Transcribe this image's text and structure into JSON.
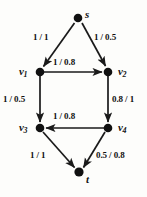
{
  "diagram": {
    "type": "directed-flow-network",
    "colors": {
      "node": "#111111",
      "edge": "#1a1a1a",
      "text": "#101010",
      "background": "#fdfdfb"
    },
    "nodes": [
      {
        "id": "s",
        "label": "s",
        "sub": "",
        "x": 78,
        "y": 18,
        "label_x": 85,
        "label_y": 9
      },
      {
        "id": "v1",
        "label": "v",
        "sub": "1",
        "x": 40,
        "y": 72,
        "label_x": 19,
        "label_y": 66
      },
      {
        "id": "v2",
        "label": "v",
        "sub": "2",
        "x": 108,
        "y": 72,
        "label_x": 118,
        "label_y": 66
      },
      {
        "id": "v3",
        "label": "v",
        "sub": "3",
        "x": 40,
        "y": 128,
        "label_x": 19,
        "label_y": 122
      },
      {
        "id": "v4",
        "label": "v",
        "sub": "4",
        "x": 108,
        "y": 128,
        "label_x": 118,
        "label_y": 122
      },
      {
        "id": "t",
        "label": "t",
        "sub": "",
        "x": 79,
        "y": 172,
        "label_x": 86,
        "label_y": 174
      }
    ],
    "edges": [
      {
        "id": "s-v1",
        "from": "s",
        "to": "v1",
        "label": "1 / 1",
        "label_x": 33,
        "label_y": 33
      },
      {
        "id": "s-v2",
        "from": "s",
        "to": "v2",
        "label": "1 / 0.5",
        "label_x": 94,
        "label_y": 33
      },
      {
        "id": "v1-v2",
        "from": "v1",
        "to": "v2",
        "label": "1 / 0.8",
        "label_x": 53,
        "label_y": 58
      },
      {
        "id": "v1-v3",
        "from": "v1",
        "to": "v3",
        "label": "1 / 0.5",
        "label_x": 3,
        "label_y": 95
      },
      {
        "id": "v2-v4",
        "from": "v2",
        "to": "v4",
        "label": "0.8 / 1",
        "label_x": 112,
        "label_y": 95
      },
      {
        "id": "v4-v3",
        "from": "v4",
        "to": "v3",
        "label": "1 / 0.8",
        "label_x": 53,
        "label_y": 112
      },
      {
        "id": "v3-t",
        "from": "v3",
        "to": "t",
        "label": "1 / 1",
        "label_x": 30,
        "label_y": 151
      },
      {
        "id": "v4-t",
        "from": "v4",
        "to": "t",
        "label": "0.5 / 0.8",
        "label_x": 97,
        "label_y": 151
      }
    ]
  }
}
